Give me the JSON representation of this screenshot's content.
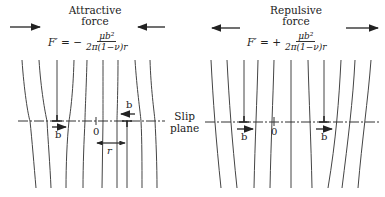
{
  "left_panel": {
    "title_line1": "Attractive",
    "title_line2": "force",
    "formula_lhs": "F′ = −",
    "formula_num": "μb²",
    "formula_den": "2π(1−ν)r",
    "origin_label": "0",
    "distance_label": "r",
    "burgers_left": "b",
    "burgers_right": "b"
  },
  "right_panel": {
    "title_line1": "Repulsive",
    "title_line2": "force",
    "formula_lhs": "F′ = +",
    "formula_num": "μb²",
    "formula_den": "2π(1−ν)r",
    "origin_label": "0",
    "burgers_left": "b",
    "burgers_right": "b"
  },
  "slip_plane_label_line1": "Slip",
  "slip_plane_label_line2": "plane",
  "colors": {
    "line": "#333333",
    "background": "#ffffff"
  }
}
